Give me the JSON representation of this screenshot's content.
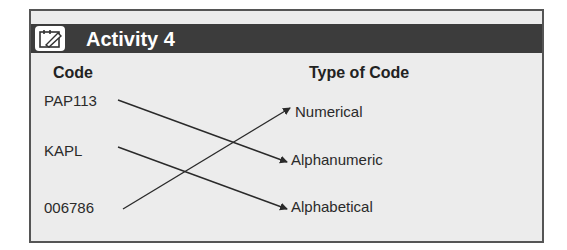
{
  "header": {
    "title": "Activity 4",
    "icon": "notepad-pencil-icon"
  },
  "columns": {
    "left": "Code",
    "right": "Type of Code"
  },
  "codes": [
    "PAP113",
    "KAPL",
    "006786"
  ],
  "types": [
    "Numerical",
    "Alphanumeric",
    "Alphabetical"
  ],
  "matches": [
    {
      "from": "PAP113",
      "to": "Alphanumeric"
    },
    {
      "from": "KAPL",
      "to": "Alphabetical"
    },
    {
      "from": "006786",
      "to": "Numerical"
    }
  ],
  "colors": {
    "header_bg": "#3c3c3c",
    "panel_bg": "#ececec",
    "border": "#555555",
    "line": "#2a2a2a"
  }
}
